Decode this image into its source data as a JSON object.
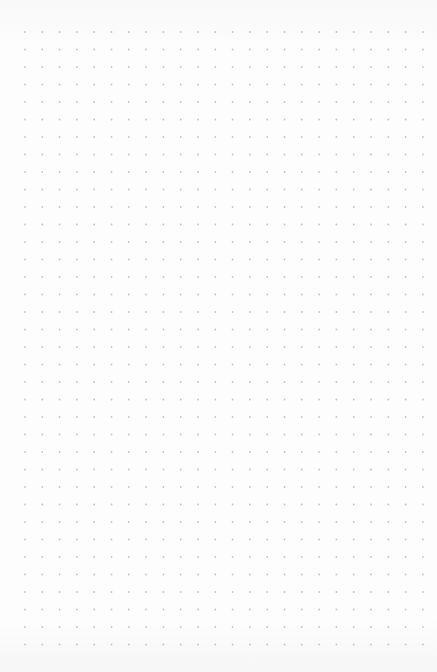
{
  "page": {
    "type": "dot-grid-paper",
    "background_color": "#fcfcfc",
    "dot_color": "#c4c4c4"
  },
  "grid": {
    "columns": 24,
    "rows": 36,
    "origin_x": 25,
    "origin_y": 32,
    "spacing_x": 17.3,
    "spacing_y": 17.5,
    "dot_radius": 0.9
  }
}
